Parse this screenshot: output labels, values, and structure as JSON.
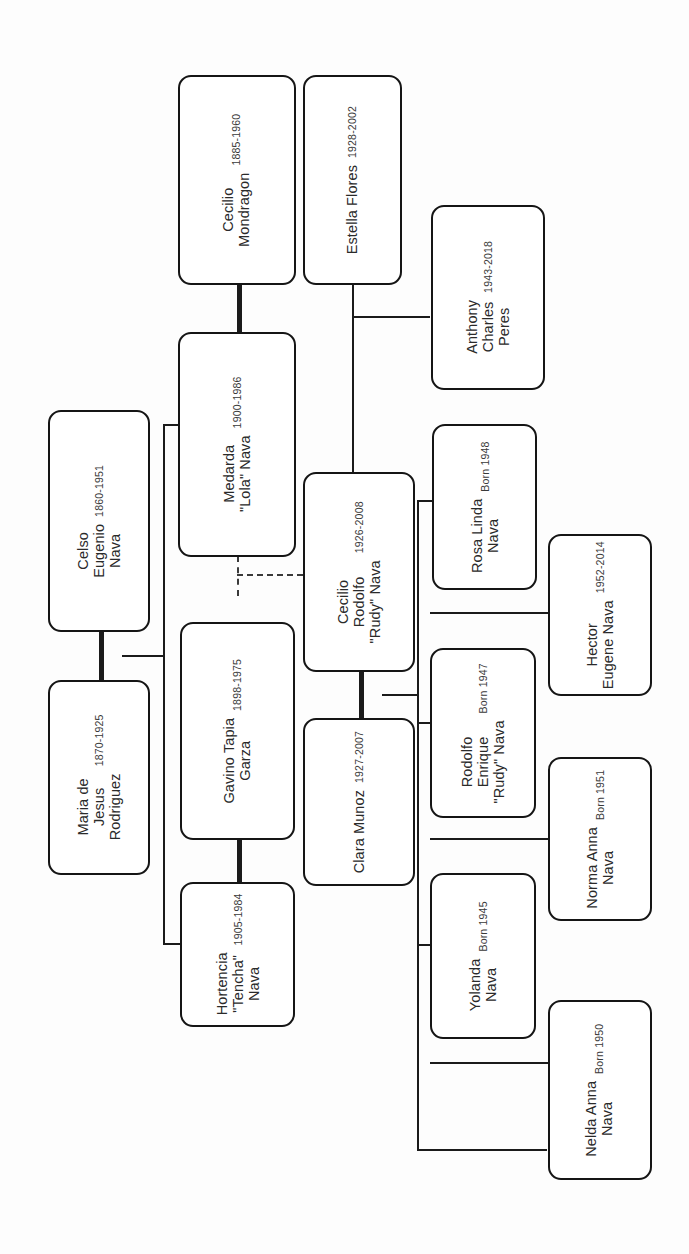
{
  "diagram": {
    "orientation": "rotated-90",
    "line_color": "#151515",
    "box_border_color": "#151515",
    "background": "#fdfdfd"
  },
  "people": [
    {
      "id": "cecilio_mondragon",
      "names": [
        "Cecilio",
        "Mondragon"
      ],
      "dates": "1885-1960"
    },
    {
      "id": "estella_flores",
      "names": [
        "Estella Flores"
      ],
      "dates": "1928-2002"
    },
    {
      "id": "anthony_charles_peres",
      "names": [
        "Anthony",
        "Charles",
        "Peres"
      ],
      "dates": "1943-2018"
    },
    {
      "id": "medarda_lola_nava",
      "names": [
        "Medarda",
        "\"Lola\" Nava"
      ],
      "dates": "1900-1986"
    },
    {
      "id": "celso_eugenio_nava",
      "names": [
        "Celso",
        "Eugenio",
        "Nava"
      ],
      "dates": "1860-1951"
    },
    {
      "id": "maria_de_jesus_rodriguez",
      "names": [
        "Maria de",
        "Jesus",
        "Rodriguez"
      ],
      "dates": "1870-1925"
    },
    {
      "id": "gavino_tapia_garza",
      "names": [
        "Gavino Tapia",
        "Garza"
      ],
      "dates": "1898-1975"
    },
    {
      "id": "hortencia_tencha_nava",
      "names": [
        "Hortencia",
        "\"Tencha\"",
        "Nava"
      ],
      "dates": "1905-1984"
    },
    {
      "id": "cecilio_rodolfo_rudy_nava",
      "names": [
        "Cecilio",
        "Rodolfo",
        "\"Rudy\" Nava"
      ],
      "dates": "1926-2008"
    },
    {
      "id": "clara_munoz",
      "names": [
        "Clara Munoz"
      ],
      "dates": "1927-2007"
    },
    {
      "id": "rosa_linda_nava",
      "names": [
        "Rosa Linda",
        "Nava"
      ],
      "dates": "Born 1948"
    },
    {
      "id": "rodolfo_enrique_rudy_nava",
      "names": [
        "Rodolfo",
        "Enrique",
        "\"Rudy\" Nava"
      ],
      "dates": "Born 1947"
    },
    {
      "id": "yolanda_nava",
      "names": [
        "Yolanda",
        "Nava"
      ],
      "dates": "Born 1945"
    },
    {
      "id": "hector_eugene_nava",
      "names": [
        "Hector",
        "Eugene Nava"
      ],
      "dates": "1952-2014"
    },
    {
      "id": "norma_anna_nava",
      "names": [
        "Norma Anna",
        "Nava"
      ],
      "dates": "Born 1951"
    },
    {
      "id": "nelda_anna_nava",
      "names": [
        "Nelda Anna",
        "Nava"
      ],
      "dates": "Born 1950"
    }
  ]
}
